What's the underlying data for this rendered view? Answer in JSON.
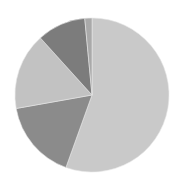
{
  "chart_data": {
    "type": "pie",
    "title": "",
    "categories": [
      "Slice 1",
      "Slice 2",
      "Slice 3",
      "Slice 4",
      "Slice 5"
    ],
    "values": [
      55.5,
      16.7,
      16.1,
      10.2,
      1.5
    ],
    "colors": [
      "#c9c9c9",
      "#8b8b8b",
      "#c2c2c2",
      "#7c7c7c",
      "#a9a9a9"
    ],
    "start_angle_deg": 0,
    "direction": "clockwise",
    "legend": "none",
    "center": [
      92,
      95
    ],
    "radius": 77
  }
}
